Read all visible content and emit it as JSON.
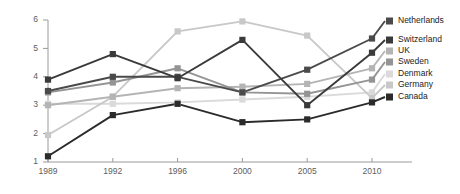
{
  "chart_data": {
    "type": "line",
    "title": "",
    "xlabel": "",
    "ylabel": "",
    "categories": [
      "1989",
      "1992",
      "1996",
      "2000",
      "2005",
      "2010"
    ],
    "x_tick_labels": [
      "1989",
      "1992",
      "1996",
      "2000",
      "2005",
      "2010"
    ],
    "y_tick_labels": [
      "1",
      "2",
      "3",
      "4",
      "5",
      "6"
    ],
    "ylim": [
      1,
      6
    ],
    "grid": false,
    "legend_position": "right",
    "marker": "square",
    "series": [
      {
        "name": "Netherlands",
        "color": "#4a4a4a",
        "values": [
          3.5,
          4.0,
          4.0,
          3.45,
          4.25,
          5.35
        ]
      },
      {
        "name": "Switzerland",
        "color": "#3a3a3a",
        "values": [
          3.9,
          4.8,
          3.95,
          5.3,
          3.0,
          4.85
        ]
      },
      {
        "name": "UK",
        "color": "#b4b4b4",
        "values": [
          3.0,
          3.3,
          3.6,
          3.65,
          3.75,
          4.3
        ]
      },
      {
        "name": "Sweden",
        "color": "#949494",
        "values": [
          3.45,
          3.8,
          4.3,
          3.45,
          3.4,
          3.9
        ]
      },
      {
        "name": "Denmark",
        "color": "#dadada",
        "values": [
          3.05,
          3.05,
          3.1,
          3.2,
          3.3,
          3.45
        ]
      },
      {
        "name": "Germany",
        "color": "#c8c8c8",
        "values": [
          1.95,
          3.3,
          5.6,
          5.95,
          5.45,
          3.25
        ]
      },
      {
        "name": "Canada",
        "color": "#2b2b2b",
        "values": [
          1.2,
          2.65,
          3.05,
          2.4,
          2.5,
          3.1
        ]
      }
    ]
  },
  "legend": {
    "items": [
      {
        "label": "Netherlands",
        "color": "#4a4a4a"
      },
      {
        "label": "Switzerland",
        "color": "#3a3a3a"
      },
      {
        "label": "UK",
        "color": "#b4b4b4"
      },
      {
        "label": "Sweden",
        "color": "#949494"
      },
      {
        "label": "Denmark",
        "color": "#dadada"
      },
      {
        "label": "Germany",
        "color": "#c8c8c8"
      },
      {
        "label": "Canada",
        "color": "#2b2b2b"
      }
    ]
  },
  "axes": {
    "y_ticks": [
      "6",
      "5",
      "4",
      "3",
      "2",
      "1"
    ],
    "x_ticks": [
      "1989",
      "1992",
      "1996",
      "2000",
      "2005",
      "2010"
    ],
    "axis_color": "#9a9a9a"
  }
}
